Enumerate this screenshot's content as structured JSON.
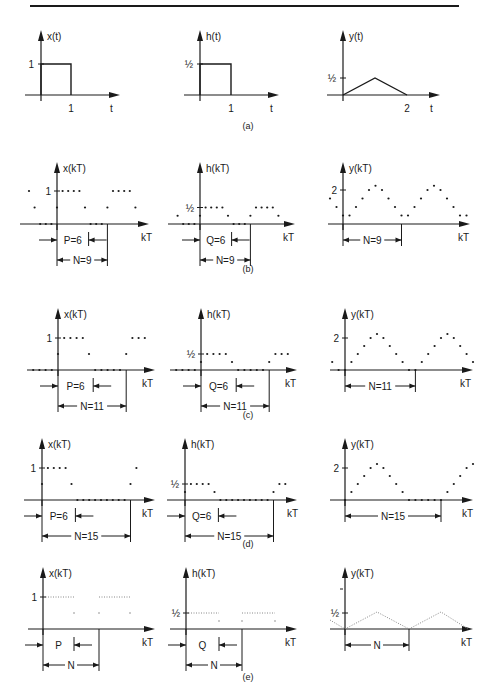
{
  "figure": {
    "captions": [
      "(a)",
      "(b)",
      "(c)",
      "(d)",
      "(e)"
    ],
    "colors": {
      "ink": "#1a1a1a",
      "paper": "#ffffff",
      "dotted": "#888888"
    }
  },
  "chart_data": [
    {
      "id": "a",
      "caption": "(a)",
      "type": "line",
      "panels": [
        {
          "ylabel": "x(t)",
          "xlabel": "t",
          "yticks": [
            "1"
          ],
          "xticks": [
            "1"
          ],
          "points": [
            [
              0,
              1
            ],
            [
              1,
              1
            ],
            [
              1,
              0
            ]
          ],
          "description": "rectangular pulse height 1 from t=0 to t=1"
        },
        {
          "ylabel": "h(t)",
          "xlabel": "t",
          "yticks": [
            "½"
          ],
          "xticks": [
            "1"
          ],
          "points": [
            [
              0,
              0.5
            ],
            [
              1,
              0.5
            ],
            [
              1,
              0
            ]
          ],
          "description": "rectangular pulse height 1/2 from t=0 to t=1"
        },
        {
          "ylabel": "y(t)",
          "xlabel": "t",
          "yticks": [
            "½"
          ],
          "xticks": [
            "2"
          ],
          "points": [
            [
              0,
              0
            ],
            [
              1,
              0.5
            ],
            [
              2,
              0
            ]
          ],
          "description": "triangle peak 1/2 at t=1, ends at t=2"
        }
      ]
    },
    {
      "id": "b",
      "caption": "(b)",
      "type": "scatter",
      "panels": [
        {
          "ylabel": "x(kT)",
          "xlabel": "kT",
          "ytick": "1",
          "P_label": "P=6",
          "N_label": "N=9",
          "k": [
            -5,
            -4,
            -3,
            -2,
            -1,
            0,
            1,
            2,
            3,
            4,
            5,
            6,
            7,
            8,
            9,
            10,
            11,
            12,
            13,
            14
          ],
          "values": [
            1,
            0.5,
            0,
            0,
            0,
            0.5,
            1,
            1,
            1,
            1,
            0.5,
            0,
            0,
            0,
            0.5,
            1,
            1,
            1,
            1,
            0.5
          ]
        },
        {
          "ylabel": "h(kT)",
          "xlabel": "kT",
          "ytick": "½",
          "P_label": "Q=6",
          "N_label": "N=9",
          "k": [
            -4,
            -3,
            -2,
            -1,
            0,
            1,
            2,
            3,
            4,
            5,
            6,
            7,
            8,
            9,
            10,
            11,
            12,
            13,
            14
          ],
          "values": [
            0.25,
            0,
            0,
            0,
            0.25,
            0.5,
            0.5,
            0.5,
            0.5,
            0.25,
            0,
            0,
            0,
            0.25,
            0.5,
            0.5,
            0.5,
            0.5,
            0.25
          ]
        },
        {
          "ylabel": "y(kT)",
          "xlabel": "kT",
          "ytick": "2",
          "N_label": "N=9",
          "k": [
            -2,
            -1,
            0,
            1,
            2,
            3,
            4,
            5,
            6,
            7,
            8,
            9,
            10,
            11,
            12,
            13,
            14,
            15,
            16,
            17,
            18,
            19
          ],
          "values": [
            1.5,
            1,
            0.5,
            0.5,
            1,
            1.5,
            2,
            2.25,
            2,
            1.5,
            1,
            0.5,
            0.5,
            1,
            1.5,
            2,
            2.25,
            2,
            1.5,
            1,
            0.5,
            0.5
          ]
        }
      ]
    },
    {
      "id": "c",
      "caption": "(c)",
      "type": "scatter",
      "panels": [
        {
          "ylabel": "x(kT)",
          "xlabel": "kT",
          "ytick": "1",
          "P_label": "P=6",
          "N_label": "N=11",
          "k": [
            -4,
            -3,
            -2,
            -1,
            0,
            1,
            2,
            3,
            4,
            5,
            6,
            7,
            8,
            9,
            10,
            11,
            12,
            13,
            14
          ],
          "values": [
            0,
            0,
            0,
            0,
            0.5,
            1,
            1,
            1,
            1,
            0.5,
            0,
            0,
            0,
            0,
            0,
            0.5,
            1,
            1,
            1
          ]
        },
        {
          "ylabel": "h(kT)",
          "xlabel": "kT",
          "ytick": "½",
          "P_label": "Q=6",
          "N_label": "N=11",
          "k": [
            -4,
            -3,
            -2,
            -1,
            0,
            1,
            2,
            3,
            4,
            5,
            6,
            7,
            8,
            9,
            10,
            11,
            12,
            13,
            14
          ],
          "values": [
            0,
            0,
            0,
            0,
            0.25,
            0.5,
            0.5,
            0.5,
            0.5,
            0.25,
            0,
            0,
            0,
            0,
            0,
            0.25,
            0.5,
            0.5,
            0.5
          ]
        },
        {
          "ylabel": "y(kT)",
          "xlabel": "kT",
          "ytick": "2",
          "N_label": "N=11",
          "k": [
            -2,
            -1,
            0,
            1,
            2,
            3,
            4,
            5,
            6,
            7,
            8,
            9,
            10,
            11,
            12,
            13,
            14,
            15,
            16,
            17,
            18,
            19,
            20
          ],
          "values": [
            0.5,
            0,
            0,
            0.5,
            1,
            1.5,
            2,
            2.25,
            2,
            1.5,
            1,
            0.5,
            0,
            0,
            0.5,
            1,
            1.5,
            2,
            2.25,
            2,
            1.5,
            1,
            0.5
          ]
        }
      ]
    },
    {
      "id": "d",
      "caption": "(d)",
      "type": "scatter",
      "panels": [
        {
          "ylabel": "x(kT)",
          "xlabel": "kT",
          "ytick": "1",
          "P_label": "P=6",
          "N_label": "N=15",
          "k": [
            0,
            1,
            2,
            3,
            4,
            5,
            6,
            7,
            8,
            9,
            10,
            11,
            12,
            13,
            14,
            15,
            16
          ],
          "values": [
            0.5,
            1,
            1,
            1,
            1,
            0.5,
            0,
            0,
            0,
            0,
            0,
            0,
            0,
            0,
            0,
            0.5,
            1
          ]
        },
        {
          "ylabel": "h(kT)",
          "xlabel": "kT",
          "ytick": "½",
          "P_label": "Q=6",
          "N_label": "N=15",
          "k": [
            0,
            1,
            2,
            3,
            4,
            5,
            6,
            7,
            8,
            9,
            10,
            11,
            12,
            13,
            14,
            15,
            16,
            17
          ],
          "values": [
            0.25,
            0.5,
            0.5,
            0.5,
            0.5,
            0.25,
            0,
            0,
            0,
            0,
            0,
            0,
            0,
            0,
            0,
            0.25,
            0.5,
            0.5
          ]
        },
        {
          "ylabel": "y(kT)",
          "xlabel": "kT",
          "ytick": "2",
          "N_label": "N=15",
          "k": [
            0,
            1,
            2,
            3,
            4,
            5,
            6,
            7,
            8,
            9,
            10,
            11,
            12,
            13,
            14,
            15,
            16,
            17,
            18,
            19,
            20
          ],
          "values": [
            0,
            0.5,
            1,
            1.5,
            2,
            2.25,
            2,
            1.5,
            1,
            0.5,
            0,
            0,
            0,
            0,
            0,
            0,
            0.5,
            1,
            1.5,
            2,
            2.25
          ]
        }
      ]
    },
    {
      "id": "e",
      "caption": "(e)",
      "type": "line",
      "panels": [
        {
          "ylabel": "x(kT)",
          "xlabel": "kT",
          "ytick": "1",
          "P_label": "P",
          "N_label": "N",
          "description": "dense dotted samples: height 1 over P, then zero, period N"
        },
        {
          "ylabel": "h(kT)",
          "xlabel": "kT",
          "ytick": "½",
          "P_label": "Q",
          "N_label": "N",
          "description": "dense dotted samples: height 1/2 over Q, then zero, period N"
        },
        {
          "ylabel": "y(kT)",
          "xlabel": "kT",
          "ytick": "½",
          "N_label": "N",
          "description": "dotted triangular wave with period N, peak slightly above 1/2"
        }
      ]
    }
  ]
}
